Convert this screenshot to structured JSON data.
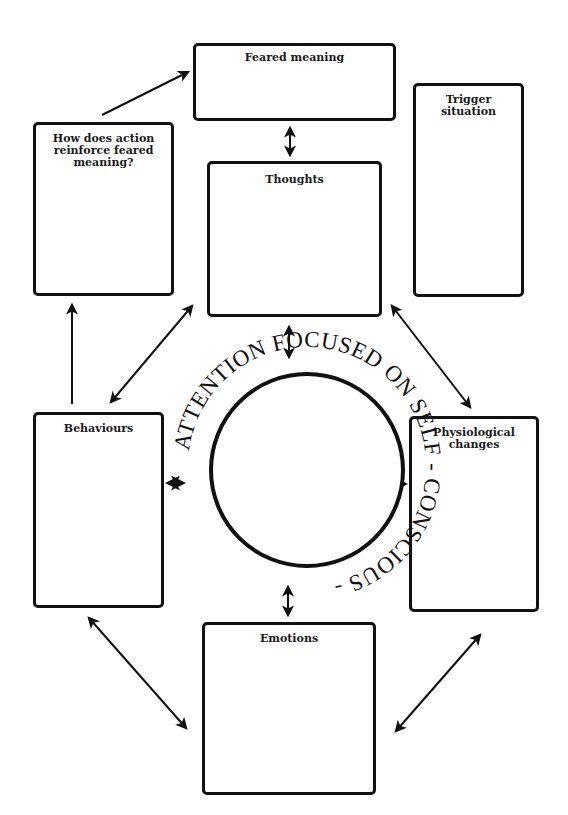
{
  "diagram": {
    "type": "cognitive-behavioural-formulation",
    "center": {
      "ring_text": "ATTENTION FOCUSED ON SELF - CONSCIOUS - "
    },
    "boxes": {
      "feared_meaning": {
        "label": "Feared meaning"
      },
      "reinforce": {
        "label": "How does action reinforce feared meaning?"
      },
      "trigger": {
        "label": "Trigger situation"
      },
      "thoughts": {
        "label": "Thoughts"
      },
      "behaviours": {
        "label": "Behaviours"
      },
      "physiological": {
        "label": "Physiological changes"
      },
      "emotions": {
        "label": "Emotions"
      }
    },
    "connections": [
      {
        "from": "reinforce",
        "to": "feared_meaning",
        "type": "one-way"
      },
      {
        "from": "feared_meaning",
        "to": "thoughts",
        "type": "two-way"
      },
      {
        "from": "thoughts",
        "to": "center",
        "type": "two-way"
      },
      {
        "from": "behaviours",
        "to": "reinforce",
        "type": "one-way"
      },
      {
        "from": "thoughts",
        "to": "behaviours",
        "type": "two-way"
      },
      {
        "from": "thoughts",
        "to": "physiological",
        "type": "two-way"
      },
      {
        "from": "behaviours",
        "to": "center",
        "type": "two-way"
      },
      {
        "from": "physiological",
        "to": "center",
        "type": "two-way"
      },
      {
        "from": "center",
        "to": "emotions",
        "type": "two-way"
      },
      {
        "from": "behaviours",
        "to": "emotions",
        "type": "two-way"
      },
      {
        "from": "physiological",
        "to": "emotions",
        "type": "two-way"
      }
    ],
    "colors": {
      "stroke": "#111111",
      "background": "#ffffff"
    }
  }
}
